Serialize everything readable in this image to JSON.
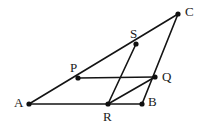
{
  "figure": {
    "kind": "geometry-diagram",
    "width": 205,
    "height": 126,
    "background_color": "#ffffff",
    "line_color": "#141414",
    "label_color": "#1a1a1a"
  },
  "labels": {
    "A": "A",
    "B": "B",
    "C": "C",
    "P": "P",
    "Q": "Q",
    "R": "R",
    "S": "S"
  },
  "chart_data": {
    "type": "scatter",
    "title": "",
    "xlabel": "",
    "ylabel": "",
    "grid": false,
    "legend": null,
    "xlim": [
      0,
      205
    ],
    "ylim": [
      126,
      0
    ],
    "points": [
      {
        "name": "A",
        "x": 29,
        "y": 104,
        "label": "A",
        "label_x": 14,
        "label_y": 96,
        "marker": "dot"
      },
      {
        "name": "B",
        "x": 142,
        "y": 104,
        "label": "B",
        "label_x": 148,
        "label_y": 95,
        "marker": "dot"
      },
      {
        "name": "C",
        "x": 178,
        "y": 14,
        "label": "C",
        "label_x": 185,
        "label_y": 5,
        "marker": "dot"
      },
      {
        "name": "P",
        "x": 78,
        "y": 78,
        "label": "P",
        "label_x": 70,
        "label_y": 61,
        "marker": "dot"
      },
      {
        "name": "Q",
        "x": 155,
        "y": 77,
        "label": "Q",
        "label_x": 162,
        "label_y": 70,
        "marker": "dot"
      },
      {
        "name": "R",
        "x": 108,
        "y": 104,
        "label": "R",
        "label_x": 103,
        "label_y": 110,
        "marker": "dot"
      },
      {
        "name": "S",
        "x": 136,
        "y": 44,
        "label": "S",
        "label_x": 130,
        "label_y": 27,
        "marker": "dot"
      }
    ],
    "segments": [
      {
        "name": "A-C",
        "from": "A",
        "to": "C",
        "x1": 29,
        "y1": 104,
        "x2": 178,
        "y2": 14,
        "passes_through": [
          "P",
          "S"
        ]
      },
      {
        "name": "A-B",
        "from": "A",
        "to": "B",
        "x1": 29,
        "y1": 104,
        "x2": 142,
        "y2": 104,
        "passes_through": [
          "R"
        ]
      },
      {
        "name": "B-C",
        "from": "B",
        "to": "C",
        "x1": 142,
        "y1": 104,
        "x2": 178,
        "y2": 14,
        "passes_through": [
          "Q"
        ]
      },
      {
        "name": "P-Q",
        "from": "P",
        "to": "Q",
        "x1": 78,
        "y1": 78,
        "x2": 155,
        "y2": 77,
        "passes_through": []
      },
      {
        "name": "R-S",
        "from": "R",
        "to": "S",
        "x1": 108,
        "y1": 104,
        "x2": 136,
        "y2": 44,
        "passes_through": []
      },
      {
        "name": "R-Q",
        "from": "R",
        "to": "Q",
        "x1": 108,
        "y1": 104,
        "x2": 155,
        "y2": 77,
        "passes_through": []
      }
    ]
  }
}
